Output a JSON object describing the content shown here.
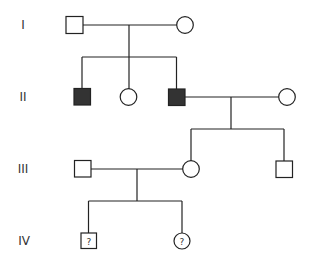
{
  "diagram": {
    "type": "pedigree",
    "generations": [
      {
        "label": "I",
        "y": 25
      },
      {
        "label": "II",
        "y": 97
      },
      {
        "label": "III",
        "y": 169
      },
      {
        "label": "IV",
        "y": 241
      }
    ],
    "individuals": [
      {
        "id": "I-1",
        "sex": "male",
        "affected": false,
        "x": 74.5,
        "y": 25,
        "mark": ""
      },
      {
        "id": "I-2",
        "sex": "female",
        "affected": false,
        "x": 185,
        "y": 25,
        "mark": ""
      },
      {
        "id": "II-1",
        "sex": "male",
        "affected": true,
        "x": 82,
        "y": 97,
        "mark": ""
      },
      {
        "id": "II-2",
        "sex": "female",
        "affected": false,
        "x": 128,
        "y": 97,
        "mark": ""
      },
      {
        "id": "II-3",
        "sex": "male",
        "affected": true,
        "x": 176.5,
        "y": 97,
        "mark": ""
      },
      {
        "id": "II-4",
        "sex": "female",
        "affected": false,
        "x": 287,
        "y": 97,
        "mark": ""
      },
      {
        "id": "III-1",
        "sex": "male",
        "affected": false,
        "x": 82.5,
        "y": 169,
        "mark": ""
      },
      {
        "id": "III-2",
        "sex": "female",
        "affected": false,
        "x": 191,
        "y": 169,
        "mark": ""
      },
      {
        "id": "III-3",
        "sex": "male",
        "affected": false,
        "x": 284,
        "y": 169,
        "mark": ""
      },
      {
        "id": "IV-1",
        "sex": "male",
        "affected": "unknown",
        "x": 88.5,
        "y": 241,
        "mark": "?"
      },
      {
        "id": "IV-2",
        "sex": "female",
        "affected": "unknown",
        "x": 182,
        "y": 241,
        "mark": "?"
      }
    ],
    "colors": {
      "line": "#222222",
      "affected_fill": "#333333",
      "unaffected_fill": "#ffffff"
    }
  }
}
